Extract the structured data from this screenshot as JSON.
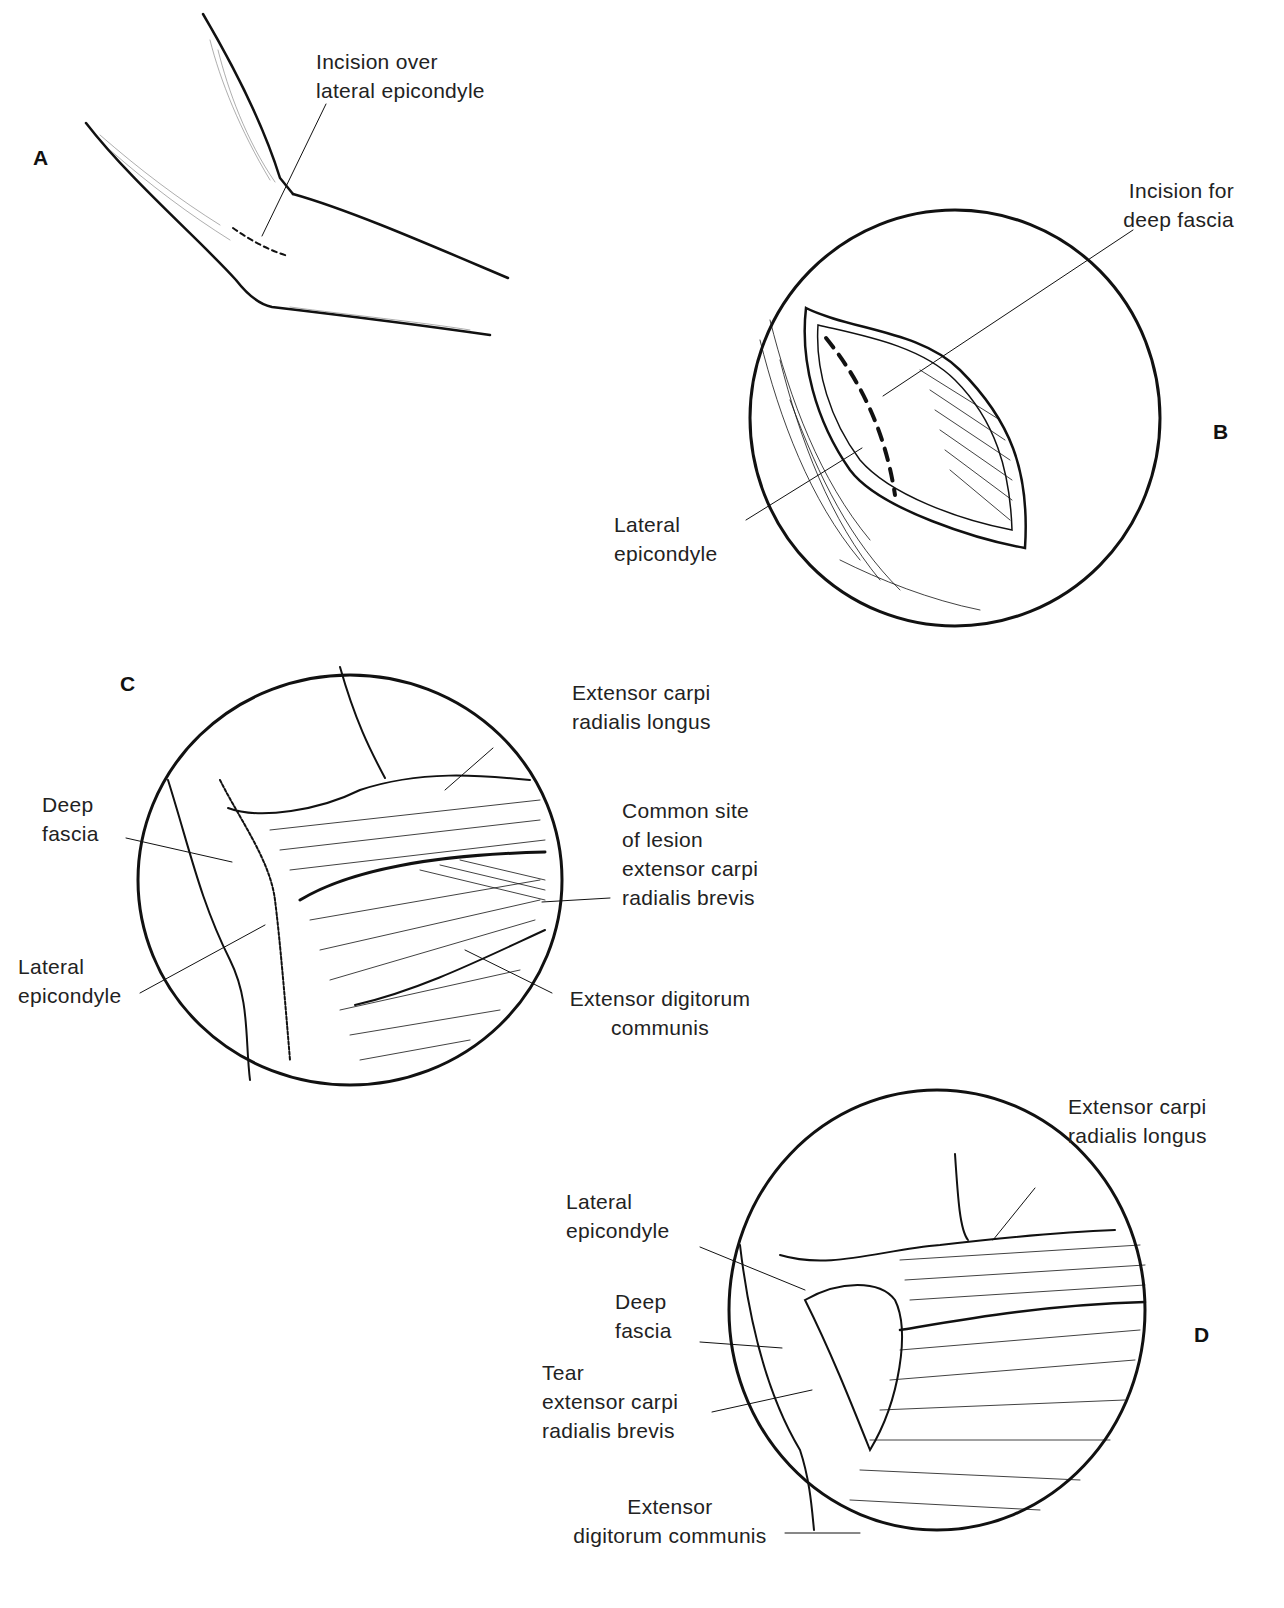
{
  "panels": {
    "A": {
      "letter": "A",
      "labels": [
        "Incision over\nlateral epicondyle"
      ]
    },
    "B": {
      "letter": "B",
      "labels": [
        "Incision for\ndeep fascia",
        "Lateral\nepicondyle"
      ]
    },
    "C": {
      "letter": "C",
      "labels": [
        "Extensor carpi\nradialis longus",
        "Deep\nfascia",
        "Common site\nof lesion\nextensor carpi\nradialis brevis",
        "Lateral\nepicondyle",
        "Extensor digitorum\ncommunis"
      ]
    },
    "D": {
      "letter": "D",
      "labels": [
        "Extensor carpi\nradialis longus",
        "Lateral\nepicondyle",
        "Deep\nfascia",
        "Tear\nextensor carpi\nradialis brevis",
        "Extensor\ndigitorum communis"
      ]
    }
  },
  "colors": {
    "ink": "#111111",
    "background": "#ffffff"
  }
}
